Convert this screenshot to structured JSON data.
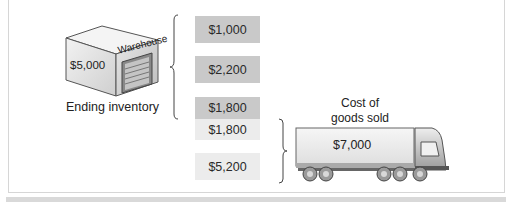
{
  "warehouse": {
    "sign": "Warehouse",
    "value": "$5,000",
    "caption": "Ending inventory"
  },
  "inventory_layers": [
    {
      "value": "$1,000",
      "group": "ending_inventory"
    },
    {
      "value": "$2,200",
      "group": "ending_inventory"
    },
    {
      "value": "$1,800",
      "group": "ending_inventory"
    },
    {
      "value": "$1,800",
      "group": "cost_of_goods_sold"
    },
    {
      "value": "$5,200",
      "group": "cost_of_goods_sold"
    }
  ],
  "truck": {
    "caption_line1": "Cost of",
    "caption_line2": "goods sold",
    "value": "$7,000"
  },
  "colors": {
    "ending_inventory_box": "#c9c9c9",
    "cogs_box": "#ececec"
  }
}
